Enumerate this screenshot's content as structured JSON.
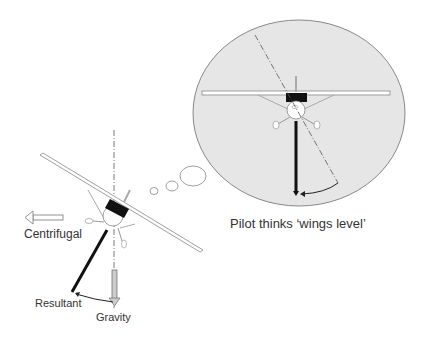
{
  "diagram": {
    "labels": {
      "centrifugal": "Centrifugal",
      "resultant": "Resultant",
      "gravity": "Gravity",
      "thought_caption": "Pilot thinks ‘wings level’"
    },
    "colors": {
      "bubble_fill": "#e6e6e6",
      "bubble_stroke": "#888888",
      "line": "#222222",
      "arrow_fill": "#cccccc"
    }
  }
}
